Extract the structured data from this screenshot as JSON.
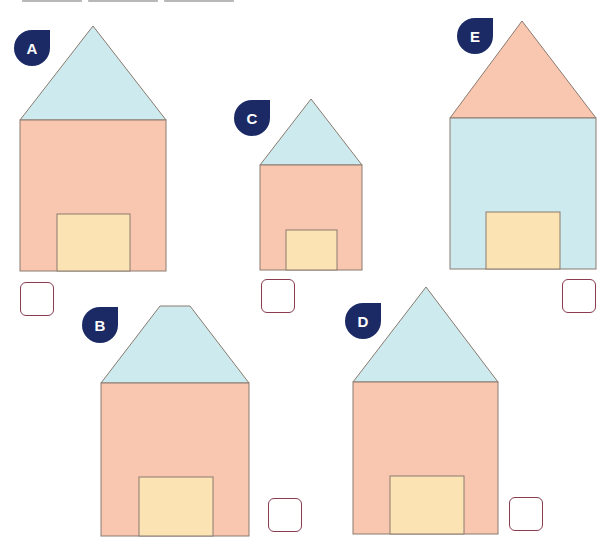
{
  "colors": {
    "salmon": "#f9c7b0",
    "light_blue": "#cdebee",
    "door_yellow": "#fce3b4",
    "outline": "#8a7a70",
    "badge_navy": "#1b2a64",
    "checkbox_border": "#8a3c50"
  },
  "houses": [
    {
      "label": "A",
      "roof_shape": "triangle",
      "roof_color": "light_blue",
      "body_color": "salmon",
      "checked": false
    },
    {
      "label": "B",
      "roof_shape": "trapezoid",
      "roof_color": "light_blue",
      "body_color": "salmon",
      "checked": false
    },
    {
      "label": "C",
      "roof_shape": "triangle",
      "roof_color": "light_blue",
      "body_color": "salmon",
      "checked": false
    },
    {
      "label": "D",
      "roof_shape": "triangle",
      "roof_color": "light_blue",
      "body_color": "salmon",
      "checked": false
    },
    {
      "label": "E",
      "roof_shape": "triangle",
      "roof_color": "salmon",
      "body_color": "light_blue",
      "checked": false
    }
  ]
}
